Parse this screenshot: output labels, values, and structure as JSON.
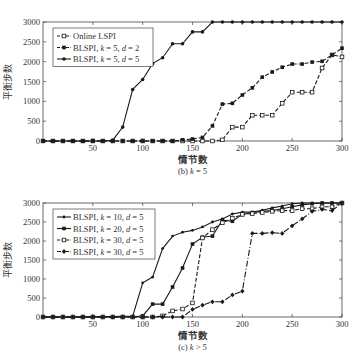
{
  "chart_data": [
    {
      "type": "line",
      "caption": "(b) k = 5",
      "title": "",
      "xlabel": "情节数",
      "ylabel": "平衡步数",
      "xlim": [
        0,
        300
      ],
      "ylim": [
        0,
        3000
      ],
      "xticks": [
        50,
        100,
        150,
        200,
        250,
        300
      ],
      "yticks": [
        0,
        500,
        1000,
        1500,
        2000,
        2500,
        3000
      ],
      "grid": false,
      "legend_position": "upper left",
      "x": [
        0,
        10,
        20,
        30,
        40,
        50,
        60,
        70,
        80,
        90,
        100,
        110,
        120,
        130,
        140,
        150,
        160,
        170,
        180,
        190,
        200,
        210,
        220,
        230,
        240,
        250,
        260,
        270,
        280,
        290,
        300
      ],
      "series": [
        {
          "name": "Online LSPI",
          "style": "dashed",
          "marker": "open-square",
          "values": [
            0,
            0,
            0,
            0,
            0,
            0,
            0,
            0,
            0,
            0,
            0,
            0,
            0,
            0,
            0,
            0,
            0,
            0,
            30,
            350,
            350,
            650,
            650,
            650,
            950,
            1230,
            1230,
            1230,
            1840,
            2170,
            2120
          ]
        },
        {
          "name": "BLSPI, k = 5, d = 2",
          "style": "dashed",
          "marker": "filled-square",
          "values": [
            0,
            0,
            0,
            0,
            0,
            0,
            0,
            0,
            0,
            0,
            0,
            0,
            0,
            0,
            30,
            50,
            90,
            380,
            930,
            950,
            1160,
            1340,
            1610,
            1740,
            1860,
            1940,
            1940,
            1990,
            2010,
            2170,
            2340
          ]
        },
        {
          "name": "BLSPI, k = 5, d = 5",
          "style": "solid",
          "marker": "filled-circle",
          "values": [
            0,
            0,
            0,
            0,
            0,
            0,
            0,
            20,
            350,
            1300,
            1550,
            1950,
            2100,
            2450,
            2450,
            2750,
            2750,
            3000,
            3000,
            3000,
            3000,
            3000,
            3000,
            3000,
            3000,
            3000,
            3000,
            3000,
            3000,
            3000,
            3000
          ]
        }
      ]
    },
    {
      "type": "line",
      "caption": "(c) k > 5",
      "title": "",
      "xlabel": "情节数",
      "ylabel": "平衡步数",
      "xlim": [
        0,
        300
      ],
      "ylim": [
        0,
        3000
      ],
      "xticks": [
        50,
        100,
        150,
        200,
        250,
        300
      ],
      "yticks": [
        0,
        500,
        1000,
        1500,
        2000,
        2500,
        3000
      ],
      "grid": false,
      "legend_position": "upper left",
      "x": [
        0,
        10,
        20,
        30,
        40,
        50,
        60,
        70,
        80,
        90,
        100,
        110,
        120,
        130,
        140,
        150,
        160,
        170,
        180,
        190,
        200,
        210,
        220,
        230,
        240,
        250,
        260,
        270,
        280,
        290,
        300
      ],
      "series": [
        {
          "name": "BLSPI, k = 10, d = 5",
          "style": "solid",
          "marker": "small-dot",
          "values": [
            0,
            0,
            0,
            0,
            0,
            10,
            10,
            10,
            20,
            20,
            900,
            1050,
            1800,
            2130,
            2230,
            2280,
            2370,
            2500,
            2580,
            2710,
            2760,
            2760,
            2810,
            2870,
            2920,
            2980,
            3000,
            3000,
            3000,
            3000,
            3000
          ]
        },
        {
          "name": "BLSPI, k = 20, d = 5",
          "style": "solid",
          "marker": "filled-square",
          "values": [
            0,
            0,
            0,
            0,
            0,
            0,
            0,
            0,
            0,
            0,
            30,
            340,
            340,
            790,
            1290,
            1920,
            2100,
            2130,
            2550,
            2520,
            2700,
            2750,
            2780,
            2800,
            2850,
            2900,
            2950,
            2980,
            3000,
            3000,
            3000
          ]
        },
        {
          "name": "BLSPI, k = 30, d = 5",
          "style": "dashed",
          "marker": "open-square",
          "values": [
            0,
            0,
            0,
            0,
            0,
            0,
            0,
            0,
            0,
            0,
            0,
            0,
            30,
            160,
            210,
            370,
            2080,
            2300,
            2480,
            2600,
            2700,
            2720,
            2750,
            2780,
            2800,
            2800,
            2850,
            2850,
            2900,
            2900,
            3000
          ]
        },
        {
          "name": "BLSPI, k = 30, d = 5",
          "style": "dashdot",
          "marker": "filled-diamond",
          "values": [
            0,
            0,
            0,
            0,
            0,
            0,
            0,
            0,
            0,
            0,
            0,
            0,
            0,
            0,
            0,
            200,
            310,
            400,
            400,
            580,
            680,
            2200,
            2200,
            2220,
            2200,
            2400,
            2580,
            2780,
            2830,
            2800,
            3000
          ]
        }
      ]
    }
  ],
  "figures": [
    {
      "caption": "(b) k = 5",
      "caption_prefix": "(b) ",
      "caption_var": "k",
      "caption_suffix": " = 5",
      "xlabel": "情节数",
      "ylabel": "平衡步数"
    },
    {
      "caption": "(c) k > 5",
      "caption_prefix": "(c) ",
      "caption_var": "k",
      "caption_suffix": " > 5",
      "xlabel": "情节数",
      "ylabel": "平衡步数"
    }
  ],
  "colors": {
    "line": "#1a1a1a",
    "axis": "#333333",
    "text": "#333333",
    "background": "#ffffff"
  }
}
